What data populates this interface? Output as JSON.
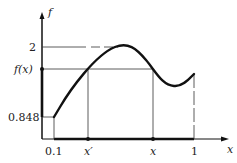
{
  "diagram": {
    "axes": {
      "y_label": "f",
      "x_label": "x"
    },
    "y_ticks": {
      "top": "2",
      "fx": "f(x)",
      "bottom": "0.848"
    },
    "x_ticks": {
      "start": "0.1",
      "xprime": "x′",
      "x": "x",
      "end": "1"
    },
    "colors": {
      "curve": "#111111",
      "guide": "#333333",
      "axis": "#111111"
    }
  }
}
